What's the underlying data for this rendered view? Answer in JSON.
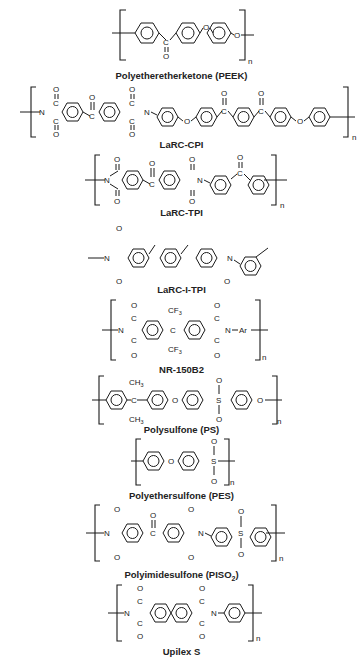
{
  "figure": {
    "structures": [
      {
        "id": "peek",
        "label": "Polyetheretherketone (PEEK)",
        "repeat": "n"
      },
      {
        "id": "larc-cpi",
        "label": "LaRC-CPI",
        "repeat": "n"
      },
      {
        "id": "larc-tpi",
        "label": "LaRC-TPI",
        "repeat": "n"
      },
      {
        "id": "larc-i-tpi",
        "label": "LaRC-I-TPI",
        "repeat": ""
      },
      {
        "id": "nr-150b2",
        "label": "NR-150B2",
        "repeat": "n",
        "substituents": [
          "CF3",
          "CF3",
          "Ar"
        ]
      },
      {
        "id": "ps",
        "label": "Polysulfone (PS)",
        "repeat": "n",
        "substituents": [
          "CH3",
          "CH3"
        ]
      },
      {
        "id": "pes",
        "label": "Polyethersulfone (PES)",
        "repeat": "n"
      },
      {
        "id": "piso2",
        "label": "Polyimidesulfone (PISO",
        "label_sub": "2",
        "label_end": ")",
        "repeat": "n"
      },
      {
        "id": "upilex-s",
        "label": "Upilex S",
        "repeat": "n"
      }
    ],
    "atoms": {
      "O": "O",
      "C": "C",
      "N": "N",
      "S": "S",
      "Ar": "Ar",
      "CF": "CF",
      "CH": "CH",
      "three": "3",
      "n": "n"
    }
  }
}
